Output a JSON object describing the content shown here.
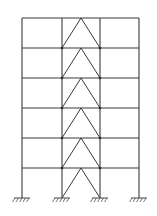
{
  "diagram": {
    "title": "Six-storey three-bay frame with chevron (inverted-V) bracing in the middle bay",
    "line_color": "#3a3a3a",
    "background": "#ffffff",
    "columns_x": [
      22,
      62,
      100,
      139
    ],
    "floors_y": [
      18,
      48,
      78,
      108,
      138,
      168
    ],
    "ground_y": 198,
    "braced_bay": {
      "left_x": 62,
      "right_x": 100,
      "apex_x": 81
    },
    "storeys": 6,
    "bays": 3,
    "supports": [
      {
        "x": 22,
        "type": "fixed"
      },
      {
        "x": 62,
        "type": "fixed"
      },
      {
        "x": 100,
        "type": "fixed"
      },
      {
        "x": 139,
        "type": "fixed"
      }
    ]
  }
}
